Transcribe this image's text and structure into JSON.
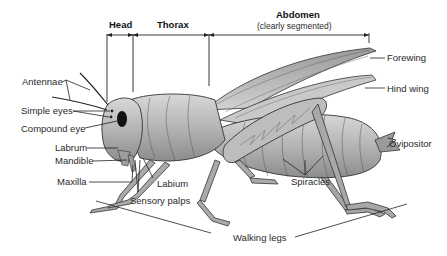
{
  "regions": {
    "head": "Head",
    "thorax": "Thorax",
    "abdomen": "Abdomen",
    "abdomen_note": "(clearly segmented)"
  },
  "labels": {
    "antennae": "Antennae",
    "simple_eyes": "Simple eyes",
    "compound_eye": "Compound eye",
    "labrum": "Labrum",
    "mandible": "Mandible",
    "maxilla": "Maxilla",
    "labium": "Labium",
    "sensory_palps": "Sensory palps",
    "forewing": "Forewing",
    "hind_wing": "Hind wing",
    "ovipositor": "Ovipositor",
    "spiracles": "Spiracles",
    "walking_legs": "Walking legs"
  },
  "colors": {
    "body": "#b9b9b9",
    "body_dark": "#7a7a7a",
    "wing": "#cfcfcf",
    "line": "#222222"
  }
}
